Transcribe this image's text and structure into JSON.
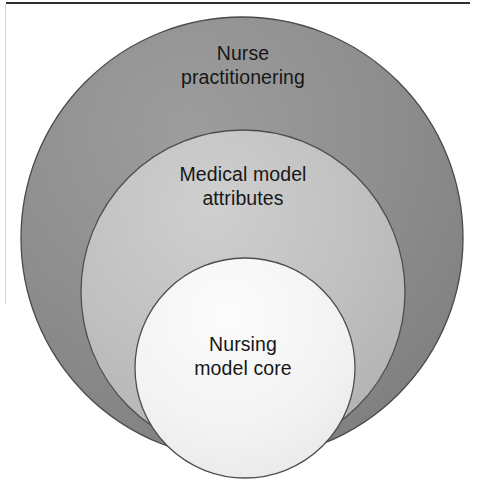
{
  "figure": {
    "kind": "nested-concentric-circles-diagram",
    "title_visible": false,
    "background_color": "#ffffff",
    "frame": {
      "top_rule_color": "#2e2e2e",
      "left_rule_color": "#d8d8d8"
    }
  },
  "circles": {
    "outer": {
      "label": "Nurse\npractitionering",
      "fill_color": "#8a8a8a",
      "fill_color_light": "#9d9d9d",
      "stroke_color": "#4a4a4a",
      "cx": 242,
      "cy": 238,
      "r": 221
    },
    "middle": {
      "label": "Medical model\nattributes",
      "fill_color": "#bdbdbd",
      "fill_color_light": "#cccccc",
      "stroke_color": "#4e4e4e",
      "cx": 243,
      "cy": 292,
      "r": 162
    },
    "inner": {
      "label": "Nursing\nmodel core",
      "fill_color": "#f2f2f2",
      "fill_color_light": "#fbfbfb",
      "stroke_color": "#4e4e4e",
      "cx": 245,
      "cy": 368,
      "r": 110
    }
  },
  "chart_data": {
    "type": "pie",
    "title": "",
    "xlabel": "",
    "ylabel": "",
    "legend_position": "none",
    "grid": false,
    "layout": "nested concentric circles, bottom-aligned, largest behind smallest",
    "categories": [
      "Nurse practitionering",
      "Medical model attributes",
      "Nursing model core"
    ],
    "values": [
      221,
      162,
      110
    ],
    "value_units": "circle radius in pixels",
    "series": [
      {
        "name": "radius",
        "values": [
          221,
          162,
          110
        ]
      },
      {
        "name": "relative_area",
        "values": [
          1.0,
          0.54,
          0.25
        ]
      }
    ],
    "annotations": [
      "Nurse practitionering",
      "Medical model attributes",
      "Nursing model core"
    ]
  }
}
